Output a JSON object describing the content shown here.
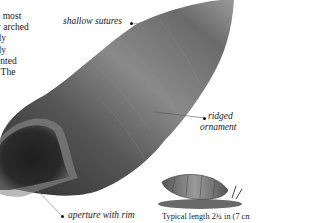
{
  "body_text": {
    "lines": [
      "e most",
      "y arched",
      "lly",
      "tly",
      "ented",
      ". The"
    ]
  },
  "annotations": {
    "shallow_sutures": "shallow sutures",
    "ridged_line1": "ridged",
    "ridged_line2": "ornament",
    "aperture": "aperture with rim"
  },
  "caption": "Typical length 2¾ in (7 cm)",
  "colors": {
    "shell_dark": "#3a3a3a",
    "shell_mid": "#7a7a7a",
    "shell_light": "#b8b8b8",
    "background": "#ffffff"
  }
}
